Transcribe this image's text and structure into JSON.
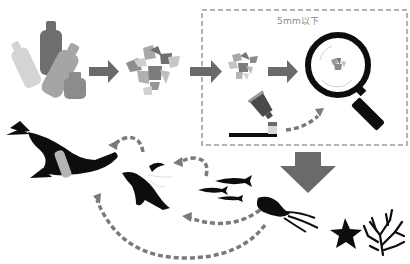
{
  "diagram": {
    "box_label": "5mm以下",
    "stages": [
      {
        "id": "bottles",
        "description": "plastic bottles"
      },
      {
        "id": "fragments",
        "description": "broken plastic fragments"
      },
      {
        "id": "small-fragments",
        "description": "small fragments"
      },
      {
        "id": "magnified",
        "description": "microplastics under magnifying glass"
      },
      {
        "id": "toothpaste",
        "description": "toothpaste / microbeads source"
      }
    ],
    "marine_life": [
      "seal",
      "penguin",
      "fish-school",
      "squid",
      "starfish",
      "coral"
    ],
    "colors": {
      "arrow_gray": "#707070",
      "dash_gray": "#8a8a8a",
      "silhouette": "#0d0d0d",
      "plastic_light": "#c8c8c8",
      "plastic_mid": "#a8a8a8",
      "plastic_dark": "#7a7a7a"
    }
  }
}
